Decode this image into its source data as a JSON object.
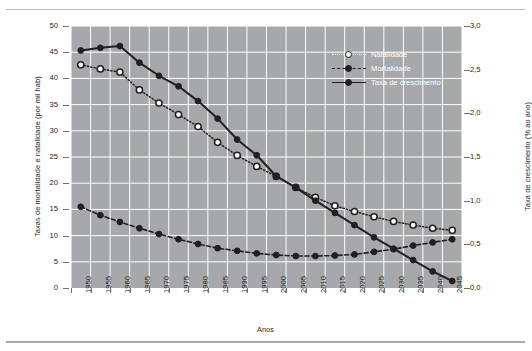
{
  "chart_data": {
    "type": "line",
    "title": "",
    "xlabel": "Anos",
    "ylabel": "Taxas de mortalidade e natalidade (por mil hab)",
    "y2label": "Taxa de crescimento (% ao ano)",
    "x": [
      1950,
      1955,
      1960,
      1965,
      1970,
      1975,
      1980,
      1985,
      1990,
      1995,
      2000,
      2005,
      2010,
      2015,
      2020,
      2025,
      2030,
      2035,
      2040,
      2045
    ],
    "xtick_labels": [
      "1950",
      "1955",
      "1960",
      "1965",
      "1970",
      "1975",
      "1980",
      "1985",
      "1990",
      "1995",
      "2000",
      "2005",
      "2010",
      "2015",
      "2020",
      "2025",
      "2030",
      "2035",
      "2040",
      "2045"
    ],
    "ylim": [
      0,
      50
    ],
    "ytick_labels": [
      "0",
      "5",
      "10",
      "15",
      "20",
      "25",
      "30",
      "35",
      "40",
      "45",
      "50"
    ],
    "ytick_values": [
      0,
      5,
      10,
      15,
      20,
      25,
      30,
      35,
      40,
      45,
      50
    ],
    "y2lim": [
      0.0,
      3.0
    ],
    "y2tick_labels": [
      "0,0",
      "0,5",
      "1,0",
      "1,5",
      "2,0",
      "2,5",
      "3,0"
    ],
    "y2tick_values": [
      0.0,
      0.5,
      1.0,
      1.5,
      2.0,
      2.5,
      3.0
    ],
    "grid": true,
    "legend_position": "upper right",
    "plot_background": "#a6a8ab",
    "grid_color": "#ffffff",
    "series": [
      {
        "name": "Natalidade",
        "axis": "left",
        "style": "dotted",
        "marker": "open-circle",
        "color": "#231f20",
        "values": [
          42.6,
          41.8,
          41.2,
          37.8,
          35.3,
          33.1,
          30.8,
          27.8,
          25.3,
          23.2,
          21.3,
          19.2,
          17.3,
          15.7,
          14.6,
          13.6,
          12.7,
          12.0,
          11.4,
          11.0
        ]
      },
      {
        "name": "Mortalidade",
        "axis": "left",
        "style": "dashed",
        "marker": "filled-circle",
        "color": "#231f20",
        "values": [
          15.5,
          13.9,
          12.6,
          11.4,
          10.3,
          9.3,
          8.4,
          7.6,
          7.1,
          6.6,
          6.3,
          6.1,
          6.1,
          6.2,
          6.4,
          6.9,
          7.4,
          8.1,
          8.7,
          9.3
        ]
      },
      {
        "name": "Taxa de crescimento",
        "axis": "right",
        "style": "solid",
        "marker": "filled-circle",
        "color": "#231f20",
        "values": [
          2.72,
          2.75,
          2.77,
          2.58,
          2.43,
          2.31,
          2.14,
          1.94,
          1.7,
          1.52,
          1.28,
          1.15,
          1.0,
          0.86,
          0.72,
          0.58,
          0.45,
          0.32,
          0.19,
          0.08
        ]
      }
    ]
  },
  "legend": {
    "items": [
      {
        "label": "Natalidade"
      },
      {
        "label": "Mortalidade"
      },
      {
        "label": "Taxa de crescimento"
      }
    ]
  }
}
